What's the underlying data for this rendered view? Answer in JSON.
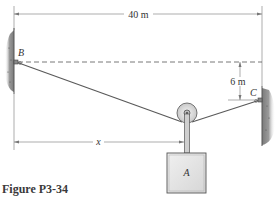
{
  "figure": {
    "caption": "Figure P3-34",
    "dimensions": {
      "span": "40 m",
      "drop": "6 m",
      "horizontal": "x"
    },
    "points": {
      "left_anchor": "B",
      "right_anchor": "C",
      "block": "A"
    }
  },
  "colors": {
    "line": "#555555",
    "wall": "#8a8a8a",
    "block_fill": "#e4e4e4",
    "pulley_fill": "#dcdcdc"
  }
}
